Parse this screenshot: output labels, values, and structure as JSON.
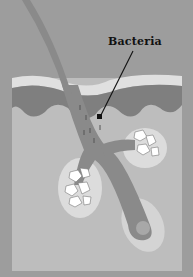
{
  "diagram": {
    "labels": [
      {
        "text": "Bacteria",
        "points_to": "follicle canal"
      }
    ]
  },
  "colors": {
    "background": "#9d9d9d",
    "dermis": "#bdbdbd",
    "epidermis_light": "#e0e0e0",
    "epidermis_dark": "#7f7f7f",
    "hair": "#8a8a8a",
    "gland_cells": "#ffffff",
    "text": "#111111"
  }
}
